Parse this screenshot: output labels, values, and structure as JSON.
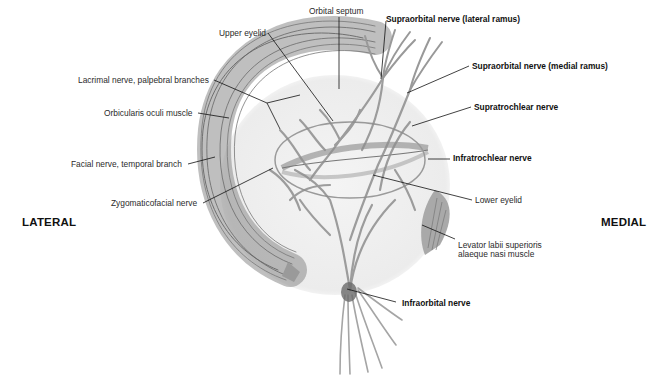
{
  "diagram": {
    "orientation": {
      "left": "LATERAL",
      "right": "MEDIAL"
    },
    "labels": [
      {
        "id": "orbital-septum",
        "text": "Orbital septum",
        "bold": false
      },
      {
        "id": "upper-eyelid",
        "text": "Upper eyelid",
        "bold": false
      },
      {
        "id": "lacrimal-nerve",
        "text": "Lacrimal nerve, palpebral branches",
        "bold": false
      },
      {
        "id": "orbicularis-oculi",
        "text": "Orbicularis oculi muscle",
        "bold": false
      },
      {
        "id": "facial-nerve",
        "text": "Facial nerve, temporal branch",
        "bold": false
      },
      {
        "id": "zygomaticofacial",
        "text": "Zygomaticofacial nerve",
        "bold": false
      },
      {
        "id": "supraorbital-lateral",
        "text": "Supraorbital nerve (lateral ramus)",
        "bold": true
      },
      {
        "id": "supraorbital-medial",
        "text": "Supraorbital nerve (medial ramus)",
        "bold": true
      },
      {
        "id": "supratrochlear",
        "text": "Supratrochlear nerve",
        "bold": true
      },
      {
        "id": "infratrochlear",
        "text": "Infratrochlear nerve",
        "bold": true
      },
      {
        "id": "lower-eyelid",
        "text": "Lower eyelid",
        "bold": false
      },
      {
        "id": "levator-labii-1",
        "text": "Levator labii superioris",
        "bold": false
      },
      {
        "id": "levator-labii-2",
        "text": "alaeque nasi muscle",
        "bold": false
      },
      {
        "id": "infraorbital",
        "text": "Infraorbital nerve",
        "bold": true
      }
    ]
  }
}
